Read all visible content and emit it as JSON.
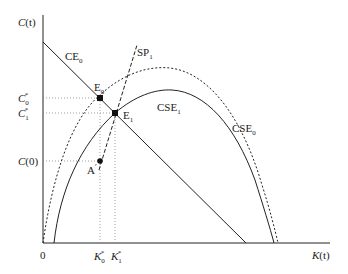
{
  "diagram": {
    "axes": {
      "y_label_main": "C",
      "y_label_arg": "(t)",
      "x_label_main": "K",
      "x_label_arg": "(t)",
      "origin_label": "0"
    },
    "y_ticks": [
      {
        "main": "C",
        "sub": "0",
        "sup": "*"
      },
      {
        "main": "C",
        "sub": "1",
        "sup": "*"
      },
      {
        "main": "C",
        "arg": "(0)"
      }
    ],
    "x_ticks": [
      {
        "main": "K",
        "sub": "0",
        "sup": "*"
      },
      {
        "main": "K",
        "sub": "1",
        "sup": "*"
      }
    ],
    "curves": {
      "ce0": {
        "main": "CE",
        "sub": "0",
        "style": "solid"
      },
      "sp1": {
        "main": "SP",
        "sub": "1",
        "style": "dashed"
      },
      "cse1": {
        "main": "CSE",
        "sub": "1",
        "style": "solid"
      },
      "cse0": {
        "main": "CSE",
        "sub": "0",
        "style": "dotted"
      }
    },
    "points": {
      "e0": {
        "main": "E",
        "sub": "0"
      },
      "e1": {
        "main": "E",
        "sub": "1"
      },
      "a_prime": {
        "main": "A",
        "sup": "′"
      }
    },
    "colors": {
      "line": "#222222",
      "guide": "#888888"
    }
  }
}
